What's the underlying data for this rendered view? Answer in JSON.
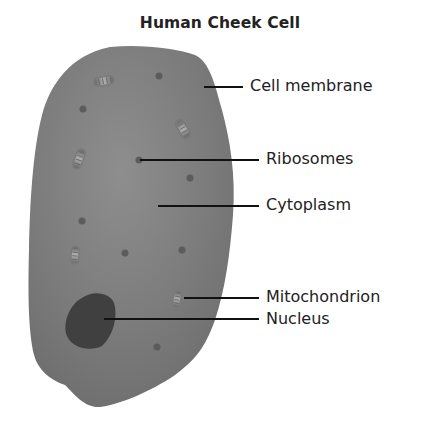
{
  "title": "Human Cheek Cell",
  "colors": {
    "cell_fill": "#777777",
    "cell_center": "#8c8c8c",
    "nucleus": "#3f3f3f",
    "ribosome": "#5a5a5a",
    "label_text": "#222222",
    "leader_line": "#111111"
  },
  "labels": [
    {
      "id": "cell-membrane",
      "text": "Cell membrane"
    },
    {
      "id": "ribosomes",
      "text": "Ribosomes"
    },
    {
      "id": "cytoplasm",
      "text": "Cytoplasm"
    },
    {
      "id": "mitochondrion",
      "text": "Mitochondrion"
    },
    {
      "id": "nucleus",
      "text": "Nucleus"
    }
  ]
}
